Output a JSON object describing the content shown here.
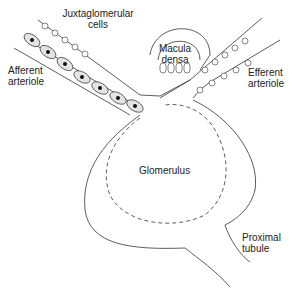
{
  "diagram": {
    "labels": {
      "juxtaglomerular": [
        "Juxtaglomerular",
        "cells"
      ],
      "macula": [
        "Macula",
        "densa"
      ],
      "afferent": [
        "Afferent",
        "arteriole"
      ],
      "efferent": [
        "Efferent",
        "arteriole"
      ],
      "glomerulus": "Glomerulus",
      "proximal": [
        "Proximal",
        "tubule"
      ]
    }
  }
}
